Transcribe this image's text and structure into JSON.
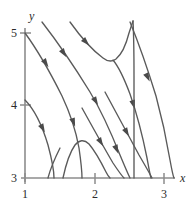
{
  "figure": {
    "background_color": "#ffffff",
    "curve_color": "#5a5a5a",
    "axis_color": "#8d8d8d",
    "text_color": "#2b2b2b"
  },
  "axes": {
    "x_axis_label": "x",
    "y_axis_label": "y",
    "x_ticks": [
      {
        "label": "1",
        "value": 1,
        "px": 25
      },
      {
        "label": "2",
        "value": 2,
        "px": 95
      },
      {
        "label": "3",
        "value": 3,
        "px": 164
      }
    ],
    "y_ticks": [
      {
        "label": "5",
        "value": 5,
        "py": 33
      },
      {
        "label": "4",
        "value": 4,
        "py": 105
      },
      {
        "label": "3",
        "value": 3,
        "py": 178
      }
    ],
    "x_range": [
      1,
      3
    ],
    "y_range": [
      3,
      5
    ]
  },
  "chart_data": {
    "type": "line",
    "title": "",
    "xlabel": "x",
    "ylabel": "y",
    "xlim": [
      1,
      3
    ],
    "ylim": [
      3,
      5
    ],
    "grid": false,
    "legend": "none",
    "series": [
      {
        "name": "curve-1-left-descending",
        "path": "M 25,100 C 33,108 42,125 48,145 C 52,160 54,171 54,178",
        "arrows": [
          {
            "x": 42,
            "y": 127,
            "angle": 62
          }
        ]
      },
      {
        "name": "curve-2-from-origin-corner",
        "path": "M 25,33 C 36,48 50,72 62,96 C 70,113 76,131 79,148 C 81,162 82,172 82,178",
        "arrows": [
          {
            "x": 45,
            "y": 62,
            "angle": 56
          },
          {
            "x": 73,
            "y": 121,
            "angle": 70
          }
        ]
      },
      {
        "name": "curve-3-long-diagonal",
        "path": "M 42,22 C 56,40 74,66 90,92 C 102,112 112,135 120,155 C 125,167 128,174 130,178",
        "arrows": [
          {
            "x": 63,
            "y": 52,
            "angle": 56
          },
          {
            "x": 95,
            "y": 100,
            "angle": 60
          },
          {
            "x": 116,
            "y": 148,
            "angle": 67
          }
        ]
      },
      {
        "name": "curve-4-u-shaped-top",
        "path": "M 70,22 C 80,36 92,50 103,58 C 108,62 112,62 116,59 C 122,54 126,45 129,33 C 131,27 132,24 133,21",
        "arrows": [
          {
            "x": 85,
            "y": 41,
            "angle": 46
          }
        ]
      },
      {
        "name": "curve-5-steep-right-branch",
        "path": "M 113,60 C 118,66 124,78 130,94 C 137,114 143,138 147,158 C 149,169 150,175 151,178",
        "arrows": [
          {
            "x": 133,
            "y": 103,
            "angle": 73
          }
        ]
      },
      {
        "name": "curve-6-near-vertical-right",
        "path": "M 133,21 C 134,40 134,58 134,76 C 134,100 134,130 134,156 C 134,168 134,174 134,178",
        "arrows": []
      },
      {
        "name": "curve-7-inverted-hump",
        "path": "M 63,178 C 66,164 70,152 75,145 C 79,140 84,139 89,144 C 95,151 101,162 106,172 C 108,176 109,177 110,178",
        "arrows": []
      },
      {
        "name": "curve-8-right-diagonal-a",
        "path": "M 130,22 C 139,44 148,70 156,96 C 162,118 167,142 170,160 C 172,171 173,176 174,178",
        "arrows": [
          {
            "x": 147,
            "y": 76,
            "angle": 64
          }
        ]
      },
      {
        "name": "curve-9-right-diagonal-b",
        "path": "M 105,92 C 116,112 128,135 139,155 C 146,167 150,174 152,178",
        "arrows": [
          {
            "x": 126,
            "y": 131,
            "angle": 61
          }
        ]
      },
      {
        "name": "curve-10-mid-diagonal",
        "path": "M 82,108 C 92,126 103,146 113,163 C 119,172 122,176 124,178",
        "arrows": [
          {
            "x": 100,
            "y": 141,
            "angle": 59
          }
        ]
      },
      {
        "name": "curve-11-short-lower",
        "path": "M 60,148 C 54,160 50,170 48,178",
        "arrows": []
      }
    ]
  }
}
